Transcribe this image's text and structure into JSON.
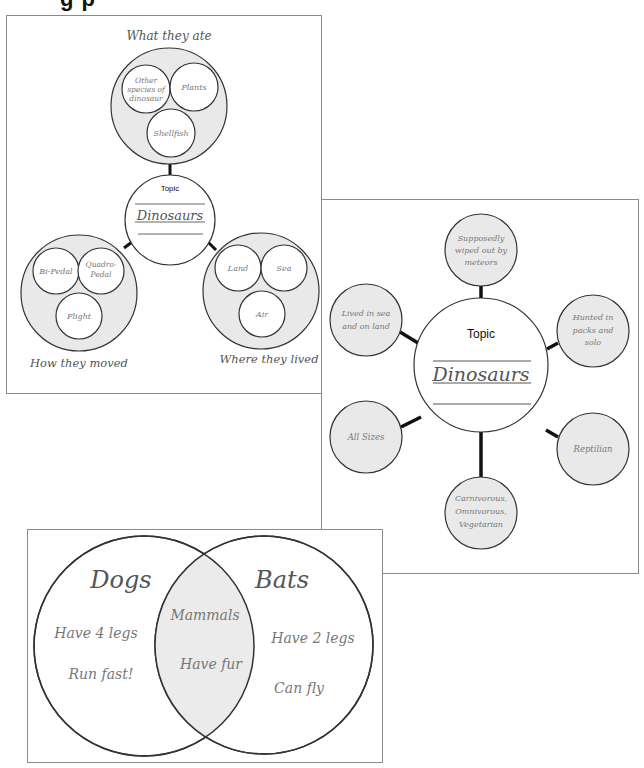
{
  "page": {
    "title_fragment": "g     p"
  },
  "cluster_map": {
    "center": {
      "label": "Topic",
      "topic": "Dinosaurs"
    },
    "clusters": [
      {
        "caption": "What they ate",
        "items": [
          "Other species of dinosaur",
          "Plants",
          "Shellfish"
        ]
      },
      {
        "caption": "How they moved",
        "items": [
          "Bi-Pedal",
          "Quadro-Pedal",
          "Flight"
        ]
      },
      {
        "caption": "Where they lived",
        "items": [
          "Land",
          "Sea",
          "Air"
        ]
      }
    ]
  },
  "bubble_map": {
    "center": {
      "label": "Topic",
      "topic": "Dinosaurs"
    },
    "bubbles": [
      {
        "lines": [
          "Supposedly",
          "wiped out by",
          "meteors"
        ]
      },
      {
        "lines": [
          "Hunted in",
          "packs and",
          "solo"
        ]
      },
      {
        "lines": [
          "Reptilian"
        ]
      },
      {
        "lines": [
          "Carnivorous,",
          "Omnivorous,",
          "Vegetarian"
        ]
      },
      {
        "lines": [
          "All Sizes"
        ]
      },
      {
        "lines": [
          "Lived in sea",
          "and on land"
        ]
      }
    ]
  },
  "venn": {
    "left": {
      "title": "Dogs",
      "items": [
        "Have 4 legs",
        "Run fast!"
      ]
    },
    "right": {
      "title": "Bats",
      "items": [
        "Have 2 legs",
        "Can fly"
      ]
    },
    "overlap": {
      "items": [
        "Mammals",
        "Have fur"
      ]
    }
  },
  "colors": {
    "fill_grey": "#e9e9e9",
    "stroke": "#333333",
    "border": "#8a8a8a"
  }
}
